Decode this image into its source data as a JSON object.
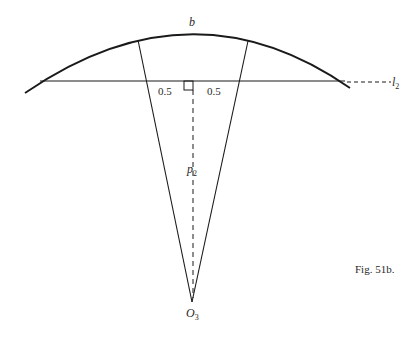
{
  "figure": {
    "caption": "Fig. 51b.",
    "labels": {
      "arc": "b",
      "line": "l",
      "line_sub": "2",
      "perpendicular": "p",
      "perpendicular_sub": "2",
      "center": "O",
      "center_sub": "3",
      "left_half": "0.5",
      "right_half": "0.5"
    },
    "colors": {
      "stroke": "#1a1a1a",
      "background": "#ffffff"
    }
  }
}
